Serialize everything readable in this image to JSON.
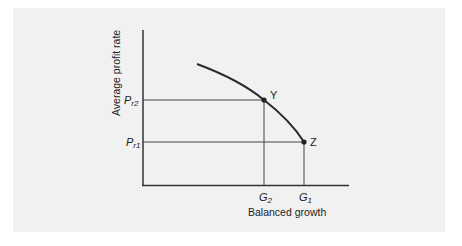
{
  "figure": {
    "y_axis_label": "Average profit rate",
    "x_axis_label": "Balanced growth",
    "y_ticks": [
      {
        "main": "P",
        "sub": "r2",
        "y": 100
      },
      {
        "main": "P",
        "sub": "r1",
        "y": 142
      }
    ],
    "x_ticks": [
      {
        "main": "G",
        "sub": "2",
        "x": 264
      },
      {
        "main": "G",
        "sub": "1",
        "x": 304
      }
    ],
    "points": [
      {
        "label": "Y"
      },
      {
        "label": "Z"
      }
    ],
    "colors": {
      "background": "#f1f1f1",
      "line": "#333333",
      "curve": "#2a2a2a"
    }
  }
}
